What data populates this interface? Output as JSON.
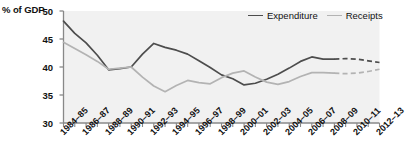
{
  "chart_data": {
    "type": "line",
    "title": "",
    "subtitle": "",
    "ylabel": "% of GDP",
    "xlabel": "",
    "ylim": [
      30,
      50
    ],
    "yticks": [
      30,
      35,
      40,
      45,
      50
    ],
    "ytick_labels": [
      "30",
      "35",
      "40",
      "45",
      "50"
    ],
    "grid": false,
    "legend_position": "top-right",
    "x": [
      "1984-85",
      "1985-86",
      "1986-87",
      "1987-88",
      "1988-89",
      "1989-90",
      "1990-91",
      "1991-92",
      "1992-93",
      "1993-94",
      "1994-95",
      "1995-96",
      "1996-97",
      "1997-98",
      "1998-99",
      "1999-00",
      "2000-01",
      "2001-02",
      "2002-03",
      "2003-04",
      "2004-05",
      "2005-06",
      "2006-07",
      "2007-08",
      "2008-09",
      "2009-10",
      "2010-11",
      "2011-12",
      "2012-13"
    ],
    "xtick_labels": [
      "1984–85",
      "1986–87",
      "1988–89",
      "1990–91",
      "1992–93",
      "1994–95",
      "1996–97",
      "1998–99",
      "2000–01",
      "2002–03",
      "2004–05",
      "2006–07",
      "2008–09",
      "2010–11",
      "2012–13"
    ],
    "forecast_start": "2008-09",
    "forecast_note": "Values from 2008-09 onward are shown as dashed (projected) lines",
    "series": [
      {
        "name": "Expenditure",
        "color": "#4d4d4d",
        "values": [
          48.2,
          46.0,
          44.3,
          42.1,
          39.5,
          39.7,
          40.0,
          42.3,
          44.2,
          43.5,
          43.0,
          42.3,
          41.1,
          39.9,
          38.6,
          37.9,
          36.8,
          37.1,
          37.8,
          38.7,
          39.8,
          41.0,
          41.8,
          41.4,
          41.4,
          41.5,
          41.4,
          41.1,
          40.8
        ]
      },
      {
        "name": "Receipts",
        "color": "#b3b3b3",
        "values": [
          44.4,
          43.3,
          42.2,
          41.0,
          39.6,
          39.8,
          40.0,
          38.2,
          36.6,
          35.6,
          36.7,
          37.6,
          37.2,
          37.0,
          38.1,
          38.9,
          39.3,
          38.2,
          37.3,
          36.9,
          37.4,
          38.3,
          39.0,
          39.0,
          38.9,
          38.8,
          38.9,
          39.2,
          39.6
        ]
      }
    ]
  },
  "legend": {
    "items": [
      {
        "label": "Expenditure",
        "color": "#4d4d4d"
      },
      {
        "label": "Receipts",
        "color": "#b3b3b3"
      }
    ]
  },
  "plot": {
    "background": "#f1f1f1",
    "axis_color": "#888888"
  }
}
